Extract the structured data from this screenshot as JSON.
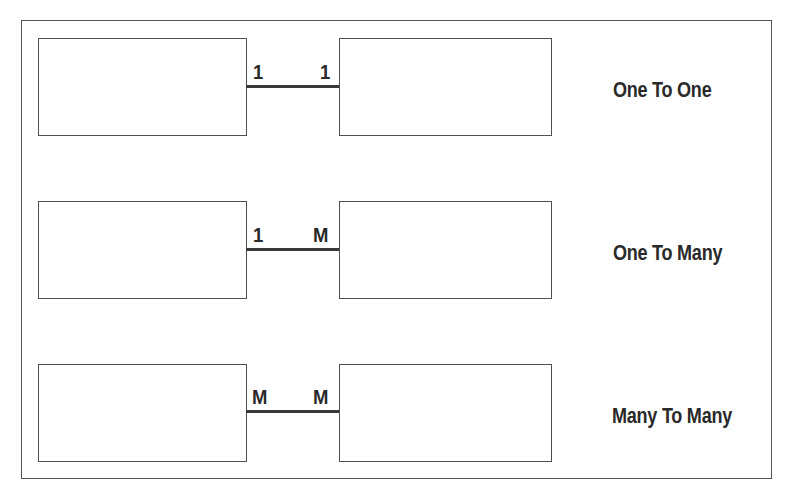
{
  "diagram": {
    "title": "",
    "colors": {
      "line": "#3a3a3a",
      "box_border": "#505050",
      "text": "#2a2a2a",
      "background": "#ffffff"
    },
    "relationships": [
      {
        "name": "One To One",
        "left_cardinality": "1",
        "right_cardinality": "1"
      },
      {
        "name": "One To Many",
        "left_cardinality": "1",
        "right_cardinality": "M"
      },
      {
        "name": "Many To Many",
        "left_cardinality": "M",
        "right_cardinality": "M"
      }
    ]
  }
}
